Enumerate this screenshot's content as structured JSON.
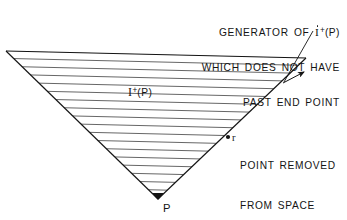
{
  "figure": {
    "kind": "line-diagram",
    "background_color": "#ffffff",
    "ink_color": "#141414",
    "hatch_color": "#4a4a4a",
    "width": 347,
    "height": 220
  },
  "captions": {
    "generator": {
      "line1_prefix": "GENERATOR OF ",
      "line1_symbol_letter": "I",
      "line1_symbol_sup": "+",
      "line1_symbol_arg": "(P)",
      "line2": "WHICH DOES NOT HAVE",
      "line3": "PAST END POINT"
    },
    "removed_point": {
      "marker_label": "r",
      "line1": "POINT REMOVED",
      "line2": "FROM SPACE"
    }
  },
  "labels": {
    "interior_region_letter": "I",
    "interior_region_sup": "+",
    "interior_region_arg": "(P)",
    "apex_point": "P"
  },
  "geometry": {
    "apex": {
      "x": 158,
      "y": 199
    },
    "top_left": {
      "x": 6,
      "y": 51
    },
    "top_right": {
      "x": 306,
      "y": 58
    },
    "removed_point_marker": {
      "x": 228,
      "y": 137
    },
    "generator_leader_start": {
      "x": 312,
      "y": 32
    },
    "generator_leader_end": {
      "x": 286,
      "y": 80
    },
    "hatch_count": 19,
    "hatch_spacing_px": 8
  }
}
